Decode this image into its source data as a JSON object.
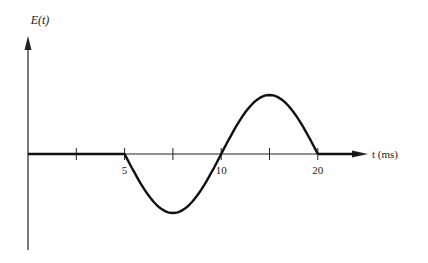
{
  "chart_data": {
    "type": "line",
    "title": "",
    "ylabel": "E(t)",
    "xlabel": "t (ms)",
    "x_tick_labels": [
      "5",
      "10",
      "20"
    ],
    "x_ticks_all": [
      1,
      2,
      3,
      4,
      5,
      6,
      7
    ],
    "x_tick_label_positions": [
      2,
      4,
      6
    ],
    "series": [
      {
        "name": "E(t)",
        "segments": [
          {
            "from": 0,
            "to": 2,
            "kind": "zero"
          },
          {
            "from": 2,
            "to": 6,
            "kind": "sine",
            "amplitude_neg": -0.5,
            "amplitude_pos": 0.5
          },
          {
            "from": 6,
            "to": 7.5,
            "kind": "zero"
          }
        ]
      }
    ]
  }
}
